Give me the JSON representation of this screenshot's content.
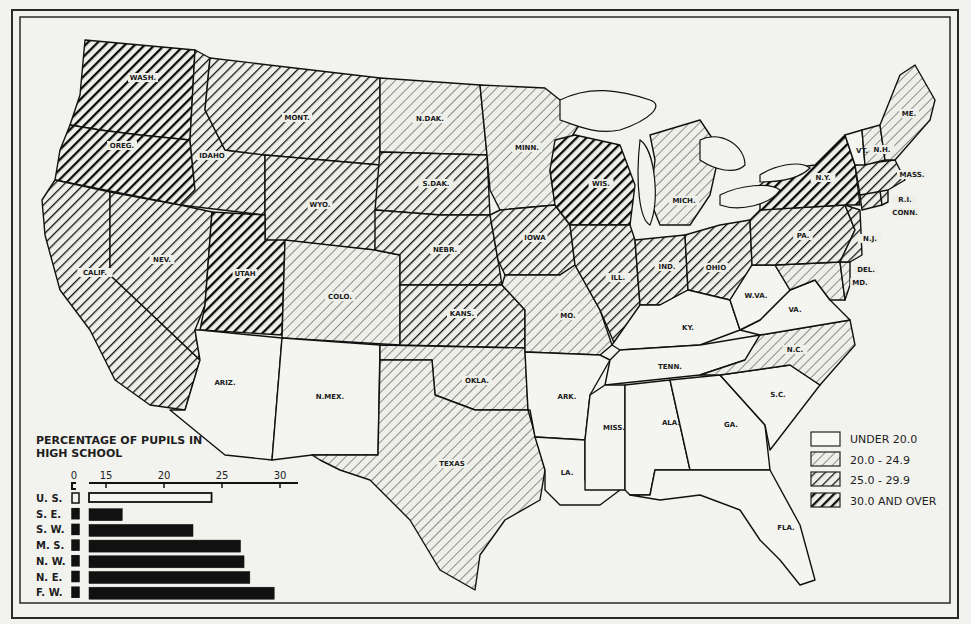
{
  "map": {
    "legend": {
      "items": [
        {
          "label": "UNDER 20.0",
          "category": "c0"
        },
        {
          "label": "20.0 - 24.9",
          "category": "c1"
        },
        {
          "label": "25.0 - 29.9",
          "category": "c2"
        },
        {
          "label": "30.0 AND OVER",
          "category": "c3"
        }
      ]
    },
    "states": [
      {
        "name": "WASH.",
        "category": "c3"
      },
      {
        "name": "OREG.",
        "category": "c3"
      },
      {
        "name": "CALIF.",
        "category": "c2"
      },
      {
        "name": "IDAHO",
        "category": "c2"
      },
      {
        "name": "NEV.",
        "category": "c2"
      },
      {
        "name": "MONT.",
        "category": "c2"
      },
      {
        "name": "WYO.",
        "category": "c2"
      },
      {
        "name": "UTAH",
        "category": "c3"
      },
      {
        "name": "COLO.",
        "category": "c1"
      },
      {
        "name": "ARIZ.",
        "category": "c0"
      },
      {
        "name": "N.MEX.",
        "category": "c0"
      },
      {
        "name": "N.DAK.",
        "category": "c1"
      },
      {
        "name": "S.DAK.",
        "category": "c2"
      },
      {
        "name": "NEBR.",
        "category": "c2"
      },
      {
        "name": "KANS.",
        "category": "c2"
      },
      {
        "name": "OKLA.",
        "category": "c1"
      },
      {
        "name": "TEXAS",
        "category": "c1"
      },
      {
        "name": "MINN.",
        "category": "c1"
      },
      {
        "name": "IOWA",
        "category": "c2"
      },
      {
        "name": "MO.",
        "category": "c1"
      },
      {
        "name": "ARK.",
        "category": "c0"
      },
      {
        "name": "LA.",
        "category": "c0"
      },
      {
        "name": "WIS.",
        "category": "c3"
      },
      {
        "name": "ILL.",
        "category": "c2"
      },
      {
        "name": "MICH.",
        "category": "c1"
      },
      {
        "name": "IND.",
        "category": "c2"
      },
      {
        "name": "OHIO",
        "category": "c2"
      },
      {
        "name": "KY.",
        "category": "c0"
      },
      {
        "name": "TENN.",
        "category": "c0"
      },
      {
        "name": "MISS.",
        "category": "c0"
      },
      {
        "name": "ALA.",
        "category": "c0"
      },
      {
        "name": "GA.",
        "category": "c0"
      },
      {
        "name": "FLA.",
        "category": "c0"
      },
      {
        "name": "S.C.",
        "category": "c0"
      },
      {
        "name": "N.C.",
        "category": "c1"
      },
      {
        "name": "VA.",
        "category": "c0"
      },
      {
        "name": "W.VA.",
        "category": "c0"
      },
      {
        "name": "MD.",
        "category": "c1"
      },
      {
        "name": "DEL.",
        "category": "c1"
      },
      {
        "name": "PA.",
        "category": "c2"
      },
      {
        "name": "N.J.",
        "category": "c2"
      },
      {
        "name": "N.Y.",
        "category": "c3"
      },
      {
        "name": "CONN.",
        "category": "c2"
      },
      {
        "name": "R.I.",
        "category": "c2"
      },
      {
        "name": "MASS.",
        "category": "c2"
      },
      {
        "name": "VT.",
        "category": "c0"
      },
      {
        "name": "N.H.",
        "category": "c1"
      },
      {
        "name": "ME.",
        "category": "c1"
      }
    ]
  },
  "chart_data": {
    "type": "bar",
    "orientation": "horizontal",
    "title": "PERCENTAGE OF PUPILS IN HIGH SCHOOL",
    "categories": [
      "U. S.",
      "S. E.",
      "S. W.",
      "M. S.",
      "N. W.",
      "N. E.",
      "F. W."
    ],
    "values": [
      24.1,
      16.4,
      22.5,
      26.6,
      26.9,
      27.4,
      29.5
    ],
    "highlight": "U. S.",
    "xlabel": "",
    "ylabel": "",
    "xticks": [
      "0",
      "15",
      "20",
      "25",
      "30"
    ],
    "xlim": [
      0,
      32
    ],
    "axis_break": "between 0 and 15"
  },
  "chart_labels": {
    "title_line1": "PERCENTAGE OF PUPILS IN",
    "title_line2": "HIGH SCHOOL",
    "ticks": [
      "0",
      "15",
      "20",
      "25",
      "30"
    ],
    "rows": [
      "U. S.",
      "S. E.",
      "S. W.",
      "M. S.",
      "N. W.",
      "N. E.",
      "F. W."
    ]
  }
}
